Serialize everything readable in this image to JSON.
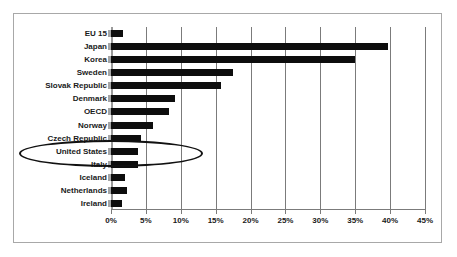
{
  "chart_data": {
    "type": "bar",
    "orientation": "horizontal",
    "title": "",
    "subtitle": "",
    "xlabel": "",
    "ylabel": "",
    "xlim": [
      0,
      45
    ],
    "xtick_labels": [
      "0%",
      "5%",
      "10%",
      "15%",
      "20%",
      "25%",
      "30%",
      "35%",
      "40%",
      "45%"
    ],
    "xtick_values": [
      0,
      5,
      10,
      15,
      20,
      25,
      30,
      35,
      40,
      45
    ],
    "grid": true,
    "legend": null,
    "bar_color": "#0d0d0d",
    "categories": [
      "EU 15",
      "Japan",
      "Korea",
      "Sweden",
      "Slovak Republic",
      "Denmark",
      "OECD",
      "Norway",
      "Czech Republic",
      "United States",
      "Italy",
      "Iceland",
      "Netherlands",
      "Ireland"
    ],
    "values": [
      1.7,
      39.7,
      35.0,
      17.5,
      15.8,
      9.2,
      8.3,
      6.0,
      4.3,
      3.8,
      3.8,
      2.0,
      2.3,
      1.6
    ],
    "annotations": [
      {
        "type": "ellipse",
        "label": "united-states-highlight",
        "target_category": "United States"
      }
    ]
  }
}
